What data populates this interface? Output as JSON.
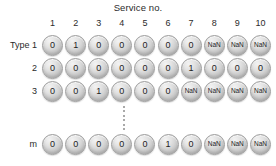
{
  "figure": {
    "title": "Service no.",
    "row_axis_label": "Type",
    "ellipsis_icon": "vertical-ellipsis-icon"
  },
  "chart_data": {
    "type": "table",
    "title": "Service no.",
    "xlabel": "Service no.",
    "ylabel": "Type",
    "grid": false,
    "legend": "none",
    "columns": [
      "1",
      "2",
      "3",
      "4",
      "5",
      "6",
      "7",
      "8",
      "9",
      "10"
    ],
    "row_labels": [
      "Type 1",
      "2",
      "3",
      "m"
    ],
    "rows": [
      {
        "label": "Type 1",
        "values": [
          "0",
          "1",
          "0",
          "0",
          "0",
          "0",
          "0",
          "NaN",
          "NaN",
          "NaN"
        ]
      },
      {
        "label": "2",
        "values": [
          "0",
          "0",
          "0",
          "0",
          "0",
          "0",
          "1",
          "0",
          "0",
          "0"
        ]
      },
      {
        "label": "3",
        "values": [
          "0",
          "0",
          "1",
          "0",
          "0",
          "0",
          "NaN",
          "NaN",
          "NaN",
          "NaN"
        ]
      },
      {
        "label": "m",
        "values": [
          "0",
          "0",
          "0",
          "0",
          "0",
          "1",
          "0",
          "NaN",
          "NaN",
          "NaN"
        ]
      }
    ],
    "row_gap_note": "vertical ellipsis between row 3 and row m"
  },
  "colors": {
    "background": "#ffffff",
    "text": "#2b2b2b",
    "bead_border": "#9c9c9c",
    "bead_fill_light": "#f3f3f3",
    "bead_fill_dark": "#a9a9a9",
    "ellipsis": "#8c8c8c"
  }
}
